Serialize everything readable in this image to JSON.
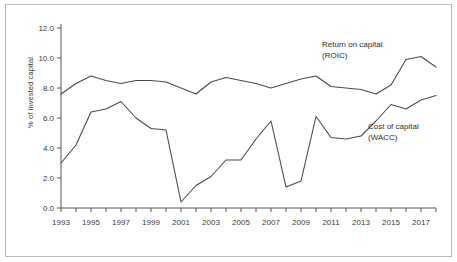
{
  "chart_data": {
    "type": "line",
    "title": "",
    "xlabel": "",
    "ylabel": "% of invested capital",
    "xlim": [
      1993,
      2018
    ],
    "ylim": [
      0.0,
      12.0
    ],
    "grid": false,
    "legend_position": "inline-annotations",
    "x": [
      1993,
      1994,
      1995,
      1996,
      1997,
      1998,
      1999,
      2000,
      2001,
      2002,
      2003,
      2004,
      2005,
      2006,
      2007,
      2008,
      2009,
      2010,
      2011,
      2012,
      2013,
      2014,
      2015,
      2016,
      2017,
      2018
    ],
    "series": [
      {
        "name": "Return on capital (ROIC)",
        "label_line1": "Return on capital",
        "label_line2": "(ROIC)",
        "color": "#4a4a4a",
        "values": [
          7.6,
          8.3,
          8.8,
          8.5,
          8.3,
          8.5,
          8.5,
          8.4,
          8.0,
          7.6,
          8.4,
          8.7,
          8.5,
          8.3,
          8.0,
          8.3,
          8.6,
          8.8,
          8.1,
          8.0,
          7.9,
          7.6,
          8.2,
          9.9,
          10.1,
          9.4
        ]
      },
      {
        "name": "Cost of capital (WACC)",
        "label_line1": "Cost of capital",
        "label_line2": "(WACC)",
        "color": "#4a4a4a",
        "values": [
          3.0,
          4.2,
          6.4,
          6.6,
          7.1,
          6.0,
          5.3,
          5.2,
          0.4,
          1.5,
          2.1,
          3.2,
          3.2,
          4.6,
          5.8,
          1.4,
          1.8,
          6.1,
          4.7,
          4.6,
          4.8,
          5.8,
          6.9,
          6.6,
          7.2,
          7.5
        ]
      }
    ],
    "y_ticks": [
      0.0,
      2.0,
      4.0,
      6.0,
      8.0,
      10.0,
      12.0
    ],
    "y_tick_labels": [
      "0.0",
      "2.0",
      "4.0",
      "6.0",
      "8.0",
      "10.0",
      "12.0"
    ],
    "x_ticks": [
      1993,
      1994,
      1995,
      1996,
      1997,
      1998,
      1999,
      2000,
      2001,
      2002,
      2003,
      2004,
      2005,
      2006,
      2007,
      2008,
      2009,
      2010,
      2011,
      2012,
      2013,
      2014,
      2015,
      2016,
      2017,
      2018
    ],
    "x_tick_labels_shown": [
      "1993",
      "1995",
      "1997",
      "1999",
      "2001",
      "2003",
      "2005",
      "2007",
      "2009",
      "2011",
      "2013",
      "2015",
      "2017"
    ],
    "axis_color": "#555555"
  }
}
